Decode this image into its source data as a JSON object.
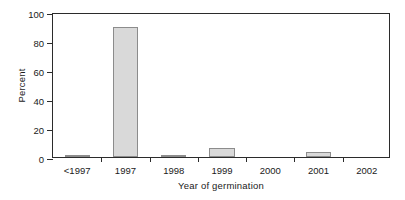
{
  "chart_data": {
    "type": "bar",
    "title": "",
    "xlabel": "Year of germination",
    "ylabel": "Percent",
    "categories": [
      "<1997",
      "1997",
      "1998",
      "1999",
      "2000",
      "2001",
      "2002"
    ],
    "values": [
      1,
      90,
      1,
      6.5,
      0,
      3.5,
      0
    ],
    "series": [
      {
        "name": "Percent",
        "values": [
          1,
          90,
          1,
          6.5,
          0,
          3.5,
          0
        ]
      }
    ],
    "ylim": [
      0,
      100
    ],
    "yticks": [
      0,
      20,
      40,
      60,
      80,
      100
    ],
    "ytick_labels": [
      "0",
      "20",
      "40",
      "60",
      "80",
      "100"
    ],
    "xtick_labels": [
      "<1997",
      "1997",
      "1998",
      "1999",
      "2000",
      "2001",
      "2002"
    ],
    "grid": false,
    "legend": "none",
    "bar_fill_color": "#d9d9d9",
    "bar_edge_color": "#8c8c8c",
    "axis_color": "#2b2b2b",
    "background_color": "#ffffff"
  }
}
